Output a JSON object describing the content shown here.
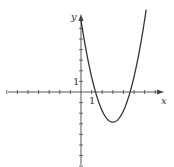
{
  "chart_data": {
    "type": "line",
    "title": "",
    "xlabel": "x",
    "ylabel": "y",
    "function_description": "Upward-opening parabola, approx y = x^2 - 6x + 7",
    "x_tick_label": "1",
    "y_tick_label": "1",
    "xlim": [
      -7,
      8
    ],
    "ylim": [
      -8,
      8
    ],
    "grid": false,
    "legend": null,
    "key_points": {
      "y_intercept": [
        0,
        7
      ],
      "vertex": [
        3,
        -2.5
      ],
      "x_intercepts": [
        1.2,
        4.8
      ]
    },
    "x": [
      0,
      0.5,
      1,
      1.5,
      2,
      2.5,
      3,
      3.5,
      4,
      4.5,
      5,
      5.5,
      6
    ],
    "values": [
      6.8,
      4.3,
      2.2,
      0.5,
      -1.0,
      -2.0,
      -2.6,
      -2.3,
      -1.3,
      0.2,
      2.0,
      4.3,
      6.8
    ]
  },
  "labels": {
    "x_axis": "x",
    "y_axis": "y",
    "x_unit": "1",
    "y_unit": "1"
  },
  "style": {
    "axis_color": "#444444",
    "curve_color": "#333333"
  }
}
